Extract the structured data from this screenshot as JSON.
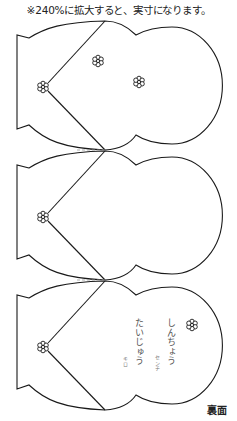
{
  "header": {
    "note": "※240%に拡大すると、実寸になります。"
  },
  "pieces": [
    {
      "id": "piece-1",
      "top": 20,
      "flowers": [
        [
          43,
          87
        ],
        [
          98,
          61
        ],
        [
          139,
          82
        ]
      ]
    },
    {
      "id": "piece-2",
      "top": 150,
      "flowers": [
        [
          43,
          217
        ]
      ]
    },
    {
      "id": "piece-3",
      "top": 280,
      "flowers": [
        [
          43,
          347
        ],
        [
          192,
          325
        ]
      ]
    }
  ],
  "card_text": {
    "height_label": "しんちょう",
    "height_unit": "センチ",
    "weight_label": "たいじゅう",
    "weight_unit": "キロ"
  },
  "footer": {
    "side_label": "裏面"
  },
  "colors": {
    "line": "#1a1a1a",
    "fold_line": "#9a9a9a",
    "background": "#ffffff"
  }
}
